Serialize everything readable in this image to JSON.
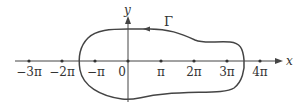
{
  "diagram": {
    "type": "contour-diagram",
    "colors": {
      "stroke": "#444444",
      "text": "#333333",
      "background": "#ffffff"
    },
    "x_axis": {
      "label": "x",
      "y": 61,
      "x_start": 15,
      "x_end": 283
    },
    "y_axis": {
      "label": "y",
      "x": 128,
      "y_start": 102,
      "y_end": 16
    },
    "ticks": [
      {
        "label": "−3π",
        "x": 29
      },
      {
        "label": "−2π",
        "x": 62
      },
      {
        "label": "−π",
        "x": 95
      },
      {
        "label": "0",
        "x": 128
      },
      {
        "label": "π",
        "x": 161
      },
      {
        "label": "2π",
        "x": 194
      },
      {
        "label": "3π",
        "x": 227
      },
      {
        "label": "4π",
        "x": 260
      }
    ],
    "curve": {
      "label": "Γ",
      "orientation": "counterclockwise",
      "description": "Closed contour enclosing −π through 3π on the real axis"
    }
  }
}
